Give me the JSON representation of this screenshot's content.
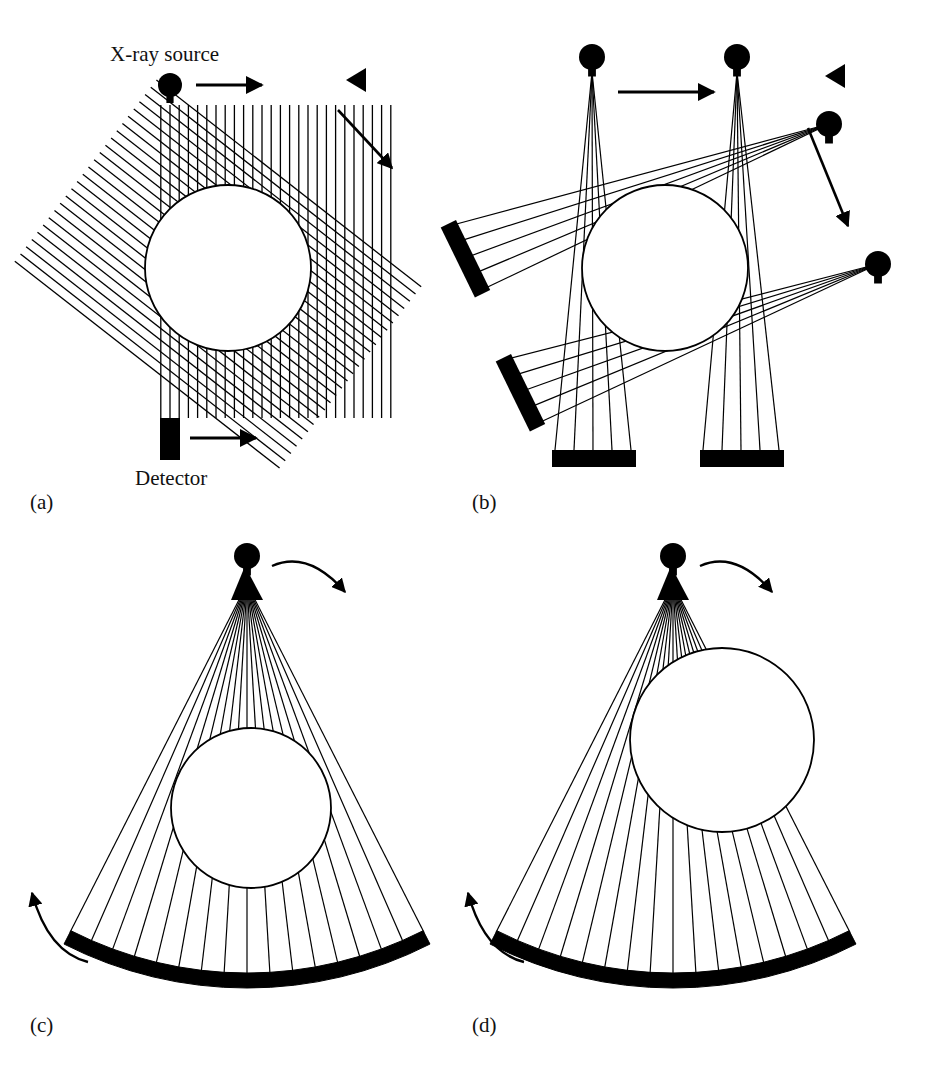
{
  "figure": {
    "title_visible": false,
    "background": "#ffffff",
    "ink": "#000000",
    "panels": [
      {
        "id": "a",
        "caption": "(a)",
        "caption_pos": [
          30,
          492
        ],
        "generation": "first-generation translate-rotate pencil beam",
        "labels": [
          {
            "name": "source-label",
            "text": "X-ray source",
            "pos": [
              110,
              44
            ]
          },
          {
            "name": "detector-label",
            "text": "Detector",
            "pos": [
              135,
              468
            ]
          }
        ],
        "source": {
          "cx": 170,
          "cy": 85,
          "r": 12
        },
        "detector": {
          "x": 160,
          "y": 418,
          "w": 20,
          "h": 42
        },
        "phantom": {
          "cx": 228,
          "cy": 268,
          "r": 83
        },
        "beam_sets": [
          {
            "angle_deg": 0,
            "count": 26,
            "spacing": 9.2
          },
          {
            "angle_deg": 38,
            "count": 26,
            "spacing": 9.2
          }
        ],
        "translate_arrows": [
          {
            "name": "translate-arrow-top",
            "from": [
              196,
              85
            ],
            "to": [
              262,
              85
            ]
          },
          {
            "name": "translate-arrow-bottom",
            "from": [
              192,
              438
            ],
            "to": [
              258,
              438
            ]
          }
        ],
        "rotation_marker": {
          "name": "rotation-triangle",
          "pos": [
            357,
            80
          ]
        },
        "rotation_arrow": {
          "from": [
            338,
            112
          ],
          "to": [
            390,
            166
          ]
        }
      },
      {
        "id": "b",
        "caption": "(b)",
        "caption_pos": [
          472,
          492
        ],
        "generation": "second-generation translate-rotate narrow fan beam",
        "labels": [],
        "sources": [
          {
            "name": "source-upper-left",
            "cx": 592,
            "cy": 57,
            "r": 13
          },
          {
            "name": "source-upper-right",
            "cx": 737,
            "cy": 57,
            "r": 13
          },
          {
            "name": "source-right-upper",
            "cx": 829,
            "cy": 124,
            "r": 13
          },
          {
            "name": "source-right-lower",
            "cx": 878,
            "cy": 264,
            "r": 13
          }
        ],
        "detectors": [
          {
            "name": "detector-bottom-left",
            "x": 552,
            "y": 450,
            "w": 82,
            "h": 16,
            "rot": 0
          },
          {
            "name": "detector-bottom-right",
            "x": 700,
            "y": 450,
            "w": 82,
            "h": 16,
            "rot": 0
          },
          {
            "name": "detector-left-upper",
            "x": 440,
            "y": 224,
            "w": 16,
            "h": 72,
            "rot": -28
          },
          {
            "name": "detector-left-lower",
            "x": 495,
            "y": 358,
            "w": 16,
            "h": 72,
            "rot": -28
          }
        ],
        "phantom": {
          "cx": 665,
          "cy": 268,
          "r": 83
        },
        "fan_rays_per_source": 5,
        "translate_arrow": {
          "name": "translate-arrow",
          "from": [
            620,
            92
          ],
          "to": [
            712,
            92
          ]
        },
        "rotation_marker": {
          "name": "rotation-triangle",
          "pos": [
            836,
            76
          ]
        },
        "rotation_arrow": {
          "from": [
            810,
            130
          ],
          "to": [
            845,
            228
          ]
        }
      },
      {
        "id": "c",
        "caption": "(c)",
        "caption_pos": [
          30,
          1015
        ],
        "generation": "third-generation rotate-rotate wide fan beam",
        "labels": [],
        "source": {
          "cx": 247,
          "cy": 556,
          "r": 13
        },
        "phantom": {
          "cx": 251,
          "cy": 808,
          "r": 80
        },
        "detector_arc": {
          "cx": 247,
          "cy": 585,
          "radius": 388,
          "half_angle_deg": 27,
          "thickness": 15
        },
        "fan_rays": 17,
        "rotation_arrow_top": {
          "from": [
            272,
            566
          ],
          "to": [
            345,
            592
          ]
        },
        "rotation_arrow_left": {
          "from": [
            88,
            962
          ],
          "to": [
            32,
            893
          ]
        }
      },
      {
        "id": "d",
        "caption": "(d)",
        "caption_pos": [
          472,
          1015
        ],
        "generation": "fourth-generation rotating source, stationary detector ring",
        "labels": [],
        "source": {
          "cx": 673,
          "cy": 556,
          "r": 13
        },
        "phantom": {
          "cx": 722,
          "cy": 740,
          "r": 92
        },
        "detector_arc": {
          "cx": 673,
          "cy": 585,
          "radius": 388,
          "half_angle_deg": 27,
          "thickness": 15
        },
        "fan_rays": 17,
        "rotation_arrow_top": {
          "from": [
            700,
            566
          ],
          "to": [
            772,
            592
          ]
        },
        "rotation_arrow_left": {
          "from": [
            524,
            962
          ],
          "to": [
            468,
            893
          ]
        }
      }
    ]
  }
}
